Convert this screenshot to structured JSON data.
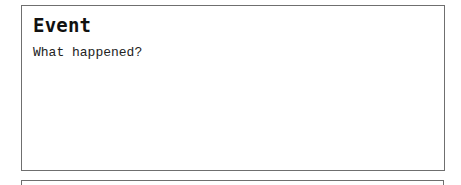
{
  "event_card": {
    "title": "Event",
    "prompt": "What happened?"
  },
  "next_card": {}
}
